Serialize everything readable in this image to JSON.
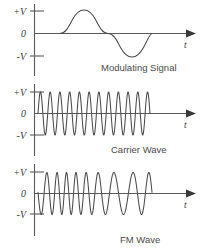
{
  "figure": {
    "background_color": "#ffffff",
    "wave_color": "#4a4a4a",
    "axis_color": "#5a5a5a",
    "text_color": "#3a3a3a"
  },
  "panels": [
    {
      "id": "modulating-signal",
      "caption": "Modulating Signal",
      "y_labels": {
        "positive": "+V",
        "zero": "0",
        "negative": "-V"
      },
      "x_label": "t"
    },
    {
      "id": "carrier-wave",
      "caption": "Carrier Wave",
      "y_labels": {
        "positive": "+V",
        "zero": "0",
        "negative": "-V"
      },
      "x_label": "t"
    },
    {
      "id": "fm-wave",
      "caption": "FM Wave",
      "y_labels": {
        "positive": "+V",
        "zero": "0",
        "negative": "-V"
      },
      "x_label": "t"
    }
  ],
  "chart_data": {
    "type": "line",
    "xlabel": "t",
    "ylabel": "V",
    "grid": false,
    "legend": "none",
    "ylim": [
      -1,
      1
    ],
    "yticks": [
      "+V",
      "0",
      "-V"
    ],
    "series": [
      {
        "name": "Modulating Signal",
        "waveform": "sine",
        "cycles": 1,
        "amplitude": 1.0,
        "x_start_px": 60,
        "x_end_px": 148,
        "description": "One full cycle of a low-frequency sine wave, positive half first"
      },
      {
        "name": "Carrier Wave",
        "waveform": "sine",
        "cycles": 11.5,
        "amplitude": 1.0,
        "x_start_px": 38,
        "x_end_px": 150,
        "description": "Constant-amplitude, constant high-frequency sinusoid"
      },
      {
        "name": "FM Wave",
        "waveform": "frequency-modulated sine",
        "amplitude": 1.0,
        "x_start_px": 38,
        "x_end_px": 152,
        "carrier_cycles_nominal": 9,
        "modulation_index": 3.2,
        "description": "Carrier whose instantaneous frequency follows the modulating sine: compressed (higher frequency) where the modulating signal is positive, stretched (lower frequency) where it is negative"
      }
    ]
  }
}
